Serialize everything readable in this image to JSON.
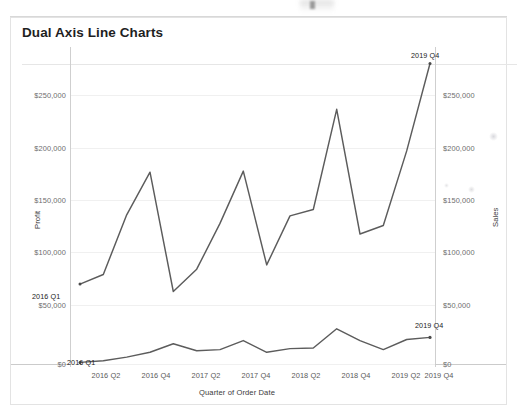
{
  "card": {
    "title": "Dual Axis Line Charts"
  },
  "chart_data": {
    "type": "line",
    "title": "Dual Axis Line Charts",
    "xlabel": "Quarter of Order Date",
    "ylabel": "Profit",
    "y2label": "Sales",
    "grid": true,
    "legend": "none",
    "x": [
      "2016 Q1",
      "2016 Q2",
      "2016 Q3",
      "2016 Q4",
      "2017 Q1",
      "2017 Q2",
      "2017 Q3",
      "2017 Q4",
      "2018 Q1",
      "2018 Q2",
      "2018 Q3",
      "2018 Q4",
      "2019 Q1",
      "2019 Q2",
      "2019 Q3",
      "2019 Q4"
    ],
    "xtick_labels": [
      "2016 Q2",
      "2016 Q4",
      "2017 Q2",
      "2017 Q4",
      "2018 Q2",
      "2018 Q4",
      "2019 Q2",
      "2019 Q4"
    ],
    "ytick_labels_left": [
      "$0",
      "$50,000",
      "$100,000",
      "$150,000",
      "$200,000",
      "$250,000"
    ],
    "ytick_labels_right": [
      "$0",
      "$50,000",
      "$100,000",
      "$150,000",
      "$200,000",
      "$250,000"
    ],
    "ylim": [
      0,
      290000
    ],
    "y2lim": [
      0,
      290000
    ],
    "series": [
      {
        "name": "Sales",
        "axis": "right",
        "color": "#5c5c5c",
        "values": [
          75000,
          84000,
          140000,
          180000,
          68000,
          89000,
          132000,
          181000,
          93000,
          139000,
          145000,
          239000,
          122000,
          130000,
          200000,
          282000
        ]
      },
      {
        "name": "Profit",
        "axis": "left",
        "color": "#5c5c5c",
        "values": [
          1500,
          3000,
          6500,
          11000,
          19000,
          12500,
          13500,
          22000,
          11000,
          14500,
          15000,
          33000,
          22000,
          13500,
          23000,
          25000
        ]
      }
    ],
    "annotations": [
      {
        "text": "2016 Q1",
        "series": "Sales",
        "point": "2016 Q1"
      },
      {
        "text": "2019 Q4",
        "series": "Sales",
        "point": "2019 Q4"
      },
      {
        "text": "2016 Q1",
        "series": "Profit",
        "point": "2016 Q1"
      },
      {
        "text": "2019 Q4",
        "series": "Profit",
        "point": "2019 Q4"
      }
    ]
  }
}
